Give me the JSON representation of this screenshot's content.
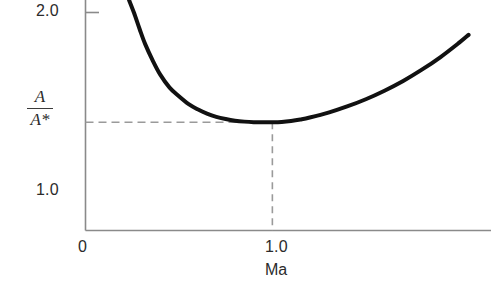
{
  "chart_data": {
    "type": "line",
    "title": "",
    "subtitle": "",
    "xlabel": "Ma",
    "ylabel": "A/A*",
    "ylabel_numerator": "A",
    "ylabel_denominator": "A*",
    "x_tick_labels": [
      "0",
      "1.0"
    ],
    "x_tick_values": [
      0,
      1.0
    ],
    "y_tick_labels": [
      "1.0",
      "2.0"
    ],
    "y_tick_values": [
      1.0,
      2.0
    ],
    "xlim": [
      0,
      2.17
    ],
    "ylim": [
      0.0,
      2.13
    ],
    "grid": false,
    "legend": null,
    "annotations": [
      {
        "name": "throat-horizontal-guide",
        "style": "dashed",
        "from": [
          0,
          1.0
        ],
        "to": [
          1.0,
          1.0
        ]
      },
      {
        "name": "throat-vertical-guide",
        "style": "dashed",
        "from": [
          1.0,
          1.0
        ],
        "to": [
          1.0,
          0.0
        ]
      }
    ],
    "series": [
      {
        "name": "Area ratio A/A*",
        "color": "#111111",
        "linewidth": 4,
        "x": [
          0.233,
          0.26,
          0.29,
          0.32,
          0.36,
          0.4,
          0.45,
          0.5,
          0.55,
          0.6,
          0.65,
          0.7,
          0.75,
          0.8,
          0.85,
          0.9,
          0.95,
          1.0,
          1.05,
          1.1,
          1.15,
          1.2,
          1.3,
          1.4,
          1.5,
          1.6,
          1.7,
          1.8,
          1.9,
          2.0,
          2.05
        ],
        "values": [
          2.13,
          2.01,
          1.86,
          1.72,
          1.57,
          1.44,
          1.32,
          1.24,
          1.17,
          1.12,
          1.08,
          1.05,
          1.03,
          1.015,
          1.006,
          1.001,
          1.0,
          1.0,
          1.003,
          1.012,
          1.026,
          1.044,
          1.089,
          1.146,
          1.213,
          1.292,
          1.382,
          1.486,
          1.603,
          1.736,
          1.808
        ]
      }
    ]
  },
  "figure": {
    "background_color": "#ffffff",
    "axis_color": "#8a8a8a",
    "guide_color": "#9a9a9a",
    "curve_color": "#111111",
    "text_color": "#2b2b2b"
  },
  "labels": {
    "y_top": "2.0",
    "y_mid": "1.0",
    "x_origin": "0",
    "x_one": "1.0",
    "x_axis_title": "Ma",
    "y_axis_numerator": "A",
    "y_axis_denominator": "A*"
  }
}
